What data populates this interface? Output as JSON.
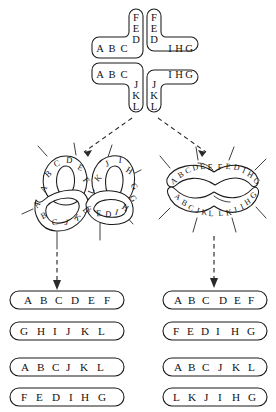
{
  "figure": {
    "ink_color": "#1a1a1a",
    "background_color": "#ffffff"
  },
  "cross": {
    "description": "Four-armed Holliday junction drawn as a cross of four elbow-shaped duplex arms",
    "arms": {
      "top_left_vertical": [
        "F",
        "E",
        "D"
      ],
      "top_right_vertical": [
        "F",
        "E",
        "D"
      ],
      "upper_left_horizontal": [
        "A",
        "B",
        "C"
      ],
      "upper_right_horizontal": [
        "I",
        "H",
        "G"
      ],
      "lower_left_horizontal": [
        "A",
        "B",
        "C"
      ],
      "lower_right_horizontal": [
        "I",
        "H",
        "G"
      ],
      "bottom_left_vertical": [
        "J",
        "K",
        "L"
      ],
      "bottom_right_vertical": [
        "J",
        "K",
        "L"
      ]
    }
  },
  "chiasma_left": {
    "label": "left chiasma configuration",
    "upper_loop_outer": [
      "A",
      "B",
      "C",
      "D",
      "E",
      "F"
    ],
    "lower_loop_outer": [
      "A",
      "B",
      "C",
      "J",
      "K",
      "L"
    ],
    "right_upper_arc": [
      "K",
      "J",
      "I",
      "H",
      "G"
    ],
    "right_lower_arc": [
      "F",
      "E",
      "D",
      "I",
      "H"
    ],
    "extra_letters": [
      "L",
      "G"
    ]
  },
  "chiasma_right": {
    "label": "right chiasma configuration",
    "upper_left_arc": [
      "A",
      "B",
      "C",
      "D",
      "E",
      "F"
    ],
    "upper_right_arc": [
      "F",
      "E",
      "D",
      "I",
      "H",
      "G"
    ],
    "lower_left_arc": [
      "A",
      "B",
      "C",
      "J",
      "K",
      "L"
    ],
    "lower_right_arc": [
      "L",
      "K",
      "J",
      "I",
      "H",
      "G"
    ]
  },
  "results_left": {
    "heading": "left resolution products",
    "products": [
      {
        "id": "left-product-1",
        "letters": [
          "A",
          "B",
          "C",
          "D",
          "E",
          "F"
        ]
      },
      {
        "id": "left-product-2",
        "letters": [
          "G",
          "H",
          "I",
          "J",
          "K",
          "L"
        ]
      },
      {
        "id": "left-product-3",
        "letters": [
          "A",
          "B",
          "C",
          "J",
          "K",
          "L"
        ]
      },
      {
        "id": "left-product-4",
        "letters": [
          "F",
          "E",
          "D",
          "I",
          "H",
          "G"
        ]
      }
    ]
  },
  "results_right": {
    "heading": "right resolution products",
    "products": [
      {
        "id": "right-product-1",
        "letters": [
          "A",
          "B",
          "C",
          "D",
          "E",
          "F"
        ]
      },
      {
        "id": "right-product-2",
        "letters": [
          "F",
          "E",
          "D",
          "I",
          "H",
          "G"
        ]
      },
      {
        "id": "right-product-3",
        "letters": [
          "A",
          "B",
          "C",
          "J",
          "K",
          "L"
        ]
      },
      {
        "id": "right-product-4",
        "letters": [
          "L",
          "K",
          "J",
          "I",
          "H",
          "G"
        ]
      }
    ]
  }
}
